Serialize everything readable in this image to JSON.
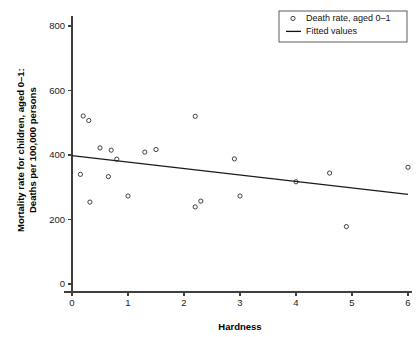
{
  "chart_data": {
    "type": "scatter",
    "title": "",
    "xlabel": "Hardness",
    "ylabel_line1": "Mortality rate for children, aged 0–1:",
    "ylabel_line2": "Deaths per 100,000 persons",
    "xlim": [
      0,
      6.25
    ],
    "ylim": [
      0,
      830
    ],
    "xticks": [
      0,
      1,
      2,
      3,
      4,
      5,
      6
    ],
    "xticklabels": [
      "0",
      "1",
      "2",
      "3",
      "4",
      "5",
      "6"
    ],
    "yticks": [
      0,
      200,
      400,
      600,
      800
    ],
    "yticklabels": [
      "0",
      "200",
      "400",
      "600",
      "800"
    ],
    "grid": false,
    "legend_position": "top-right",
    "legend": [
      {
        "label": "Death rate, aged 0–1",
        "marker": "open-circle"
      },
      {
        "label": "Fitted values",
        "marker": "line"
      }
    ],
    "series": [
      {
        "name": "Death rate, aged 0–1",
        "marker": "open-circle",
        "points": [
          {
            "x": 0.15,
            "y": 340
          },
          {
            "x": 0.2,
            "y": 521
          },
          {
            "x": 0.3,
            "y": 507
          },
          {
            "x": 0.32,
            "y": 254
          },
          {
            "x": 0.5,
            "y": 422
          },
          {
            "x": 0.65,
            "y": 333
          },
          {
            "x": 0.7,
            "y": 415
          },
          {
            "x": 0.8,
            "y": 387
          },
          {
            "x": 1.0,
            "y": 273
          },
          {
            "x": 1.3,
            "y": 409
          },
          {
            "x": 1.5,
            "y": 417
          },
          {
            "x": 2.2,
            "y": 520
          },
          {
            "x": 2.2,
            "y": 239
          },
          {
            "x": 2.3,
            "y": 257
          },
          {
            "x": 2.9,
            "y": 388
          },
          {
            "x": 3.0,
            "y": 273
          },
          {
            "x": 4.0,
            "y": 317
          },
          {
            "x": 4.6,
            "y": 344
          },
          {
            "x": 4.9,
            "y": 178
          },
          {
            "x": 6.0,
            "y": 362
          }
        ]
      },
      {
        "name": "Fitted values",
        "marker": "line",
        "line_endpoints": [
          {
            "x": 0.0,
            "y": 398
          },
          {
            "x": 6.0,
            "y": 278
          }
        ],
        "slope": -20,
        "intercept": 398
      }
    ]
  }
}
